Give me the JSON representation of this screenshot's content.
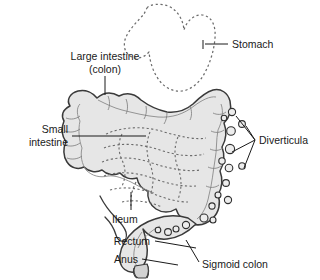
{
  "figure": {
    "background_color": "#ffffff",
    "organ_fill": "#e6e6e6",
    "organ_fill_dark": "#d2d2d2",
    "outline_color": "#3a3a3a",
    "dashed_color": "#6b6b6b",
    "label_color": "#1a1a1a",
    "leader_color": "#1a1a1a"
  },
  "labels": {
    "large_intestine_line1": "Large intestine",
    "large_intestine_line2": "(colon)",
    "stomach": "Stomach",
    "small_intestine_line1": "Small",
    "small_intestine_line2": "intestine",
    "diverticula": "Diverticula",
    "ileum": "Ileum",
    "rectum": "Rectum",
    "anus": "Anus",
    "sigmoid_colon": "Sigmoid colon"
  },
  "structures": [
    {
      "name": "stomach",
      "style": "dashed-outline",
      "label": "Stomach"
    },
    {
      "name": "large-intestine-colon",
      "style": "filled-haustra",
      "label": "Large intestine (colon)"
    },
    {
      "name": "small-intestine",
      "style": "dashed-loops",
      "label": "Small intestine"
    },
    {
      "name": "ileum",
      "style": "dashed-segment",
      "label": "Ileum"
    },
    {
      "name": "sigmoid-colon",
      "style": "filled",
      "label": "Sigmoid colon"
    },
    {
      "name": "rectum",
      "style": "filled",
      "label": "Rectum"
    },
    {
      "name": "anus",
      "style": "filled",
      "label": "Anus"
    },
    {
      "name": "diverticula",
      "style": "small-circles",
      "label": "Diverticula",
      "count": 18
    }
  ]
}
